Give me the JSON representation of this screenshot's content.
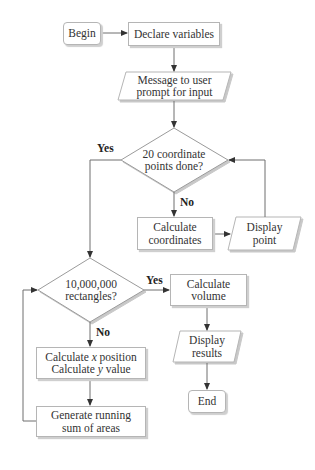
{
  "diagram": {
    "type": "flowchart",
    "nodes": {
      "begin": {
        "label": "Begin",
        "shape": "rounded-rect"
      },
      "declare": {
        "label": "Declare variables",
        "shape": "rect"
      },
      "message": {
        "line1": "Message to user",
        "line2": "prompt for input",
        "shape": "parallelogram"
      },
      "decision1": {
        "line1": "20 coordinate",
        "line2": "points done?",
        "shape": "diamond"
      },
      "calc_coords": {
        "line1": "Calculate",
        "line2": "coordinates",
        "shape": "rect"
      },
      "display_point": {
        "line1": "Display",
        "line2": "point",
        "shape": "parallelogram"
      },
      "decision2": {
        "line1": "10,000,000",
        "line2": "rectangles?",
        "shape": "diamond"
      },
      "calc_volume": {
        "line1": "Calculate",
        "line2": "volume",
        "shape": "rect"
      },
      "display_results": {
        "line1": "Display",
        "line2": "results",
        "shape": "parallelogram"
      },
      "end": {
        "label": "End",
        "shape": "rounded-rect"
      },
      "calc_xy": {
        "line1_pre": "Calculate ",
        "line1_var": "x",
        "line1_post": " position",
        "line2_pre": "Calculate ",
        "line2_var": "y",
        "line2_post": " value",
        "shape": "rect"
      },
      "running_sum": {
        "line1": "Generate running",
        "line2": "sum of areas",
        "shape": "rect"
      }
    },
    "edge_labels": {
      "d1_yes": "Yes",
      "d1_no": "No",
      "d2_yes": "Yes",
      "d2_no": "No"
    },
    "colors": {
      "stroke": "#6e6e6e",
      "border": "#b5b5b5",
      "shadow": "#cfcfcf",
      "text": "#333333"
    }
  }
}
